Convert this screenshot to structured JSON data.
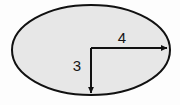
{
  "figure": {
    "kind": "ellipse-with-semi-axis-dimensions",
    "background_color": "#fdfdfd",
    "shape": {
      "name": "ellipse",
      "fill_color": "#e7e7e7",
      "stroke_color": "#111111",
      "stroke_width": 2,
      "center_x": 91,
      "center_y": 50,
      "radius_x": 79,
      "radius_y": 45
    },
    "dimensions": [
      {
        "id": "semi-major-axis",
        "label": "4",
        "orientation": "horizontal",
        "color": "#111111",
        "from_x": 91,
        "from_y": 48,
        "to_x": 168,
        "to_y": 48,
        "label_x": 122,
        "label_y": 39
      },
      {
        "id": "semi-minor-axis",
        "label": "3",
        "orientation": "vertical",
        "color": "#111111",
        "from_x": 91,
        "from_y": 48,
        "to_x": 91,
        "to_y": 94,
        "label_x": 77,
        "label_y": 67
      }
    ]
  },
  "chart_data": {
    "type": "diagram",
    "title": "",
    "shape": "ellipse",
    "annotations": [
      {
        "label": "4",
        "meaning": "horizontal semi-axis length",
        "value": 4
      },
      {
        "label": "3",
        "meaning": "vertical semi-axis length",
        "value": 3
      }
    ]
  }
}
